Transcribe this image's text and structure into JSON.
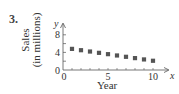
{
  "problem_number": "3.",
  "chart_data": {
    "type": "scatter",
    "title": "",
    "xlabel": "Year",
    "ylabel": "Sales (in millions)",
    "ylabel_lines": [
      "Sales",
      "(in millions)"
    ],
    "x_axis_var": "x",
    "y_axis_var": "y",
    "x": [
      1,
      2,
      3,
      4,
      5,
      6,
      7,
      8,
      9,
      10
    ],
    "values": [
      4.8,
      4.5,
      4.2,
      3.9,
      3.6,
      3.3,
      3.0,
      2.7,
      2.4,
      2.1
    ],
    "xticks": [
      0,
      5,
      10
    ],
    "yticks": [
      0,
      4,
      8
    ],
    "xlim": [
      0,
      11
    ],
    "ylim": [
      0,
      10
    ],
    "grid": false,
    "marker": "square",
    "marker_color": "#555555",
    "legend": null
  }
}
